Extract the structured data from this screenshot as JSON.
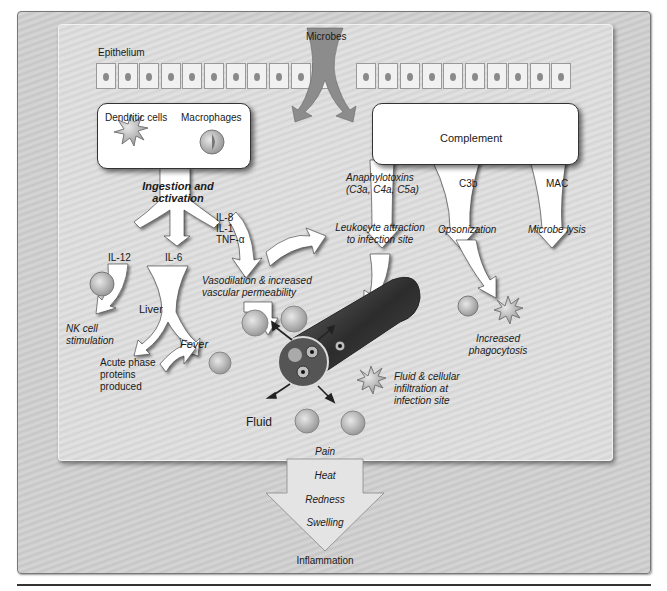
{
  "diagram": {
    "type": "flow-diagram",
    "topic": "Innate immune response leading to inflammation",
    "labels": {
      "epithelium": "Epithelium",
      "microbes": "Microbes",
      "dendritic_cells": "Dendritic cells",
      "macrophages": "Macrophages",
      "complement": "Complement",
      "ingestion_line1": "Ingestion and",
      "ingestion_line2": "activation",
      "anaphylatoxins_line1": "Anaphylotoxins",
      "anaphylatoxins_line2": "(C3a, C4a, C5a)",
      "c3b": "C3b",
      "mac": "MAC",
      "leukocyte_line1": "Leukocyte attraction",
      "leukocyte_line2": "to infection site",
      "opsonization": "Opsonization",
      "microbe_lysis": "Microbe lysis",
      "cytokines_il8": "IL-8",
      "cytokines_il1": "IL-1",
      "cytokines_tnf": "TNF-α",
      "il12": "IL-12",
      "il6": "IL-6",
      "vaso_line1": "Vasodilation & increased",
      "vaso_line2": "vascular permeability",
      "liver": "Liver",
      "nk_line1": "NK cell",
      "nk_line2": "stimulation",
      "fever": "Fever",
      "acute_line1": "Acute phase",
      "acute_line2": "proteins",
      "acute_line3": "produced",
      "phago_line1": "Increased",
      "phago_line2": "phagocytosis",
      "infil_line1": "Fluid & cellular",
      "infil_line2": "infiltration at",
      "infil_line3": "infection site",
      "fluid": "Fluid",
      "pain": "Pain",
      "heat": "Heat",
      "redness": "Redness",
      "swelling": "Swelling",
      "inflammation": "Inflammation"
    },
    "nodes": [
      "Epithelium",
      "Microbes",
      "Dendritic cells",
      "Macrophages",
      "Complement",
      "IL-12",
      "IL-6",
      "IL-8 / IL-1 / TNF-α",
      "NK cell stimulation",
      "Liver",
      "Acute phase proteins produced",
      "Fever",
      "Vasodilation & increased vascular permeability",
      "Leukocyte attraction to infection site",
      "Opsonization",
      "Increased phagocytosis",
      "Microbe lysis",
      "Fluid & cellular infiltration at infection site",
      "Inflammation"
    ],
    "edges": [
      {
        "from": "Microbes",
        "to": "Dendritic cells / Macrophages"
      },
      {
        "from": "Microbes",
        "to": "Complement"
      },
      {
        "from": "Dendritic cells / Macrophages",
        "to": "IL-12",
        "label": "Ingestion and activation"
      },
      {
        "from": "Dendritic cells / Macrophages",
        "to": "IL-6"
      },
      {
        "from": "Dendritic cells / Macrophages",
        "to": "IL-8 / IL-1 / TNF-α"
      },
      {
        "from": "IL-12",
        "to": "NK cell stimulation"
      },
      {
        "from": "IL-6",
        "to": "Liver"
      },
      {
        "from": "Liver",
        "to": "Acute phase proteins produced"
      },
      {
        "from": "Liver",
        "to": "Fever"
      },
      {
        "from": "IL-8 / IL-1 / TNF-α",
        "to": "Vasodilation & increased vascular permeability"
      },
      {
        "from": "IL-8 / IL-1 / TNF-α",
        "to": "Leukocyte attraction to infection site"
      },
      {
        "from": "Complement",
        "to": "Leukocyte attraction to infection site",
        "label": "Anaphylotoxins (C3a, C4a, C5a)"
      },
      {
        "from": "Complement",
        "to": "Opsonization",
        "label": "C3b"
      },
      {
        "from": "Complement",
        "to": "Microbe lysis",
        "label": "MAC"
      },
      {
        "from": "Opsonization",
        "to": "Increased phagocytosis"
      },
      {
        "from": "Leukocyte attraction to infection site",
        "to": "Fluid & cellular infiltration at infection site"
      },
      {
        "from": "Fluid & cellular infiltration at infection site",
        "to": "Inflammation",
        "label": "Pain, Heat, Redness, Swelling"
      }
    ],
    "colors": {
      "background": "#d4d4d4",
      "panel": "#dedede",
      "box": "#ffffff",
      "arrow": "#ffffff",
      "microbe_arrow": "#8c8c8c",
      "vessel": "#3a3a3a"
    }
  }
}
